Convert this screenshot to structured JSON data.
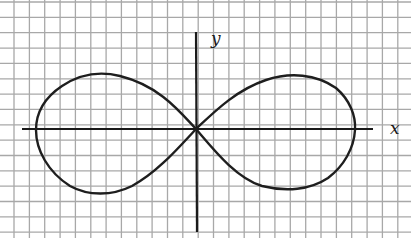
{
  "figure": {
    "type": "figure-eight curve (lemniscate) on graph paper",
    "axes": {
      "x_label": "x",
      "y_label": "y"
    },
    "colors": {
      "background": "#ffffff",
      "grid": "#a8a8a8",
      "ink": "#1e1e1e"
    },
    "curve": {
      "name": "lemniscate",
      "lobes": [
        "left",
        "right"
      ],
      "crosses_origin": true
    }
  }
}
